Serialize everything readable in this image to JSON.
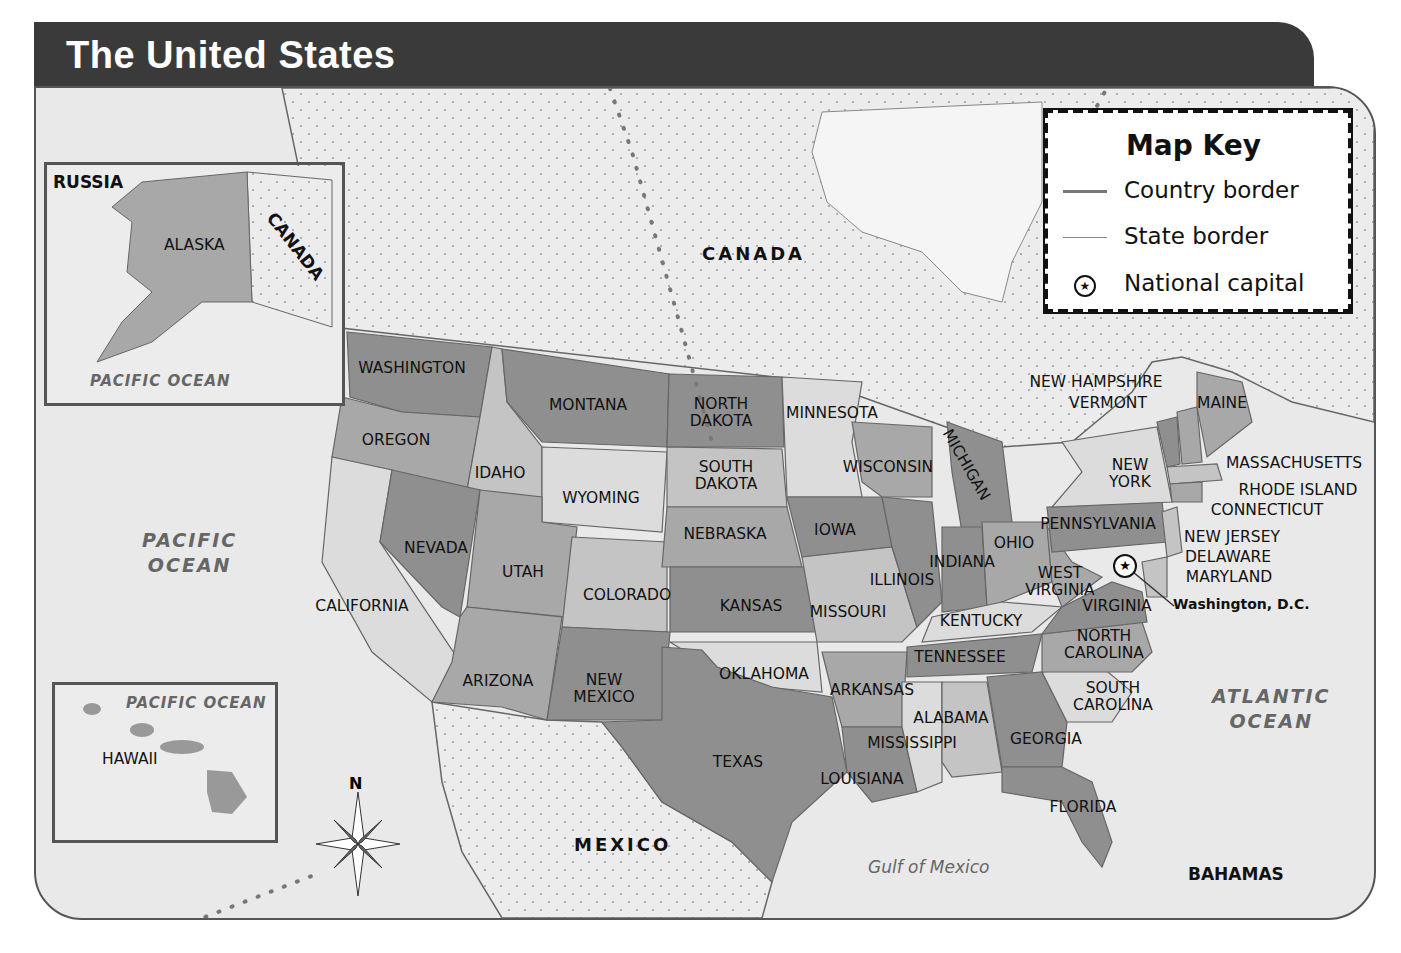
{
  "title": "The United States",
  "map_key": {
    "title": "Map Key",
    "items": [
      {
        "symbol": "country-border-line",
        "label": "Country border"
      },
      {
        "symbol": "state-border-line",
        "label": "State border"
      },
      {
        "symbol": "star-in-circle",
        "glyph": "★",
        "label": "National capital"
      }
    ]
  },
  "insets": {
    "alaska": {
      "labels": {
        "country_west": "RUSSIA",
        "state": "ALASKA",
        "country_east": "CANADA",
        "ocean": "PACIFIC OCEAN"
      }
    },
    "hawaii": {
      "labels": {
        "state": "HAWAII",
        "ocean": "PACIFIC OCEAN"
      }
    }
  },
  "compass": {
    "north_label": "N"
  },
  "countries": {
    "canada": "CANADA",
    "mexico": "MEXICO",
    "bahamas": "BAHAMAS"
  },
  "water": {
    "pacific_line1": "PACIFIC",
    "pacific_line2": "OCEAN",
    "atlantic_line1": "ATLANTIC",
    "atlantic_line2": "OCEAN",
    "gulf": "Gulf of Mexico"
  },
  "capital": {
    "label": "Washington, D.C."
  },
  "states": [
    {
      "name": "WASHINGTON",
      "x": 412,
      "y": 368
    },
    {
      "name": "OREGON",
      "x": 396,
      "y": 440
    },
    {
      "name": "CALIFORNIA",
      "x": 362,
      "y": 606
    },
    {
      "name": "IDAHO",
      "x": 500,
      "y": 473
    },
    {
      "name": "NEVADA",
      "x": 436,
      "y": 548
    },
    {
      "name": "MONTANA",
      "x": 588,
      "y": 405
    },
    {
      "name": "WYOMING",
      "x": 601,
      "y": 498
    },
    {
      "name": "UTAH",
      "x": 523,
      "y": 572
    },
    {
      "name": "ARIZONA",
      "x": 498,
      "y": 681
    },
    {
      "name": "COLORADO",
      "x": 627,
      "y": 595
    },
    {
      "name": "NEW MEXICO",
      "x": 604,
      "y": 689
    },
    {
      "name": "NORTH DAKOTA",
      "x": 721,
      "y": 413
    },
    {
      "name": "SOUTH DAKOTA",
      "x": 726,
      "y": 476
    },
    {
      "name": "NEBRASKA",
      "x": 725,
      "y": 534
    },
    {
      "name": "KANSAS",
      "x": 751,
      "y": 606
    },
    {
      "name": "OKLAHOMA",
      "x": 764,
      "y": 674
    },
    {
      "name": "TEXAS",
      "x": 738,
      "y": 762
    },
    {
      "name": "MINNESOTA",
      "x": 832,
      "y": 413
    },
    {
      "name": "IOWA",
      "x": 835,
      "y": 530
    },
    {
      "name": "MISSOURI",
      "x": 848,
      "y": 612
    },
    {
      "name": "ARKANSAS",
      "x": 872,
      "y": 690
    },
    {
      "name": "LOUISIANA",
      "x": 862,
      "y": 779
    },
    {
      "name": "WISCONSIN",
      "x": 888,
      "y": 467
    },
    {
      "name": "ILLINOIS",
      "x": 902,
      "y": 580
    },
    {
      "name": "MICHIGAN",
      "x": 966,
      "y": 465,
      "rotate": 60
    },
    {
      "name": "INDIANA",
      "x": 962,
      "y": 562
    },
    {
      "name": "OHIO",
      "x": 1014,
      "y": 543
    },
    {
      "name": "KENTUCKY",
      "x": 981,
      "y": 621
    },
    {
      "name": "TENNESSEE",
      "x": 960,
      "y": 657
    },
    {
      "name": "MISSISSIPPI",
      "x": 912,
      "y": 743
    },
    {
      "name": "ALABAMA",
      "x": 951,
      "y": 718
    },
    {
      "name": "GEORGIA",
      "x": 1046,
      "y": 739
    },
    {
      "name": "FLORIDA",
      "x": 1083,
      "y": 807
    },
    {
      "name": "SOUTH CAROLINA",
      "x": 1113,
      "y": 697
    },
    {
      "name": "NORTH CAROLINA",
      "x": 1104,
      "y": 645
    },
    {
      "name": "VIRGINIA",
      "x": 1117,
      "y": 606
    },
    {
      "name": "WEST VIRGINIA",
      "x": 1060,
      "y": 582
    },
    {
      "name": "PENNSYLVANIA",
      "x": 1098,
      "y": 524
    },
    {
      "name": "NEW YORK",
      "x": 1130,
      "y": 474
    },
    {
      "name": "VERMONT",
      "x": 1108,
      "y": 403
    },
    {
      "name": "NEW HAMPSHIRE",
      "x": 1096,
      "y": 382
    },
    {
      "name": "MAINE",
      "x": 1222,
      "y": 403
    },
    {
      "name": "MASSACHUSETTS",
      "x": 1294,
      "y": 463
    },
    {
      "name": "RHODE ISLAND",
      "x": 1298,
      "y": 490
    },
    {
      "name": "CONNECTICUT",
      "x": 1267,
      "y": 510
    },
    {
      "name": "NEW JERSEY",
      "x": 1232,
      "y": 537
    },
    {
      "name": "DELAWARE",
      "x": 1228,
      "y": 557
    },
    {
      "name": "MARYLAND",
      "x": 1229,
      "y": 577
    }
  ],
  "colors": {
    "title_bar": "#3a3a3a",
    "ocean": "#e9e9e9",
    "foreign_land": "#ededed",
    "state_dark": "#8f8f8f",
    "state_medium": "#a8a8a8",
    "state_light": "#c4c4c4",
    "state_lightest": "#dcdcdc",
    "water_label": "#666666"
  }
}
